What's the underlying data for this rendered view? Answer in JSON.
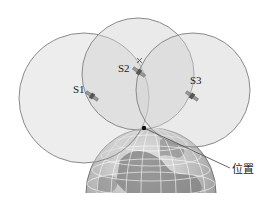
{
  "diagram": {
    "satellites": [
      {
        "id": "s1",
        "label": "S1",
        "cx": 84,
        "cy": 98,
        "r": 65,
        "sat_x": 92,
        "sat_y": 96
      },
      {
        "id": "s2",
        "label": "S2",
        "cx": 138,
        "cy": 74,
        "r": 56,
        "sat_x": 139,
        "sat_y": 72
      },
      {
        "id": "s3",
        "label": "S3",
        "cx": 193,
        "cy": 90,
        "r": 57,
        "sat_x": 192,
        "sat_y": 96
      }
    ],
    "position_label": "位置",
    "position_point": {
      "x": 144,
      "y": 128
    },
    "colors": {
      "circle_fill": "#d8d8d8",
      "circle_stroke": "#8a8a8a",
      "globe_ocean": "#cfcfcf",
      "globe_land": "#7d7d7d",
      "grid": "#ffffff",
      "leader": "#555555",
      "dot": "#111111"
    }
  }
}
